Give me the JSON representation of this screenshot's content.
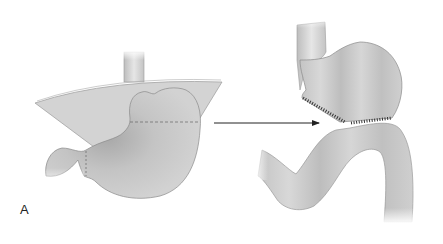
{
  "figure": {
    "panel_label": "A",
    "colors": {
      "tissue_fill": "#c9c9c9",
      "tissue_dark": "#9a9a9a",
      "tissue_light": "#e4e4e4",
      "outline": "#8a8a8a",
      "arrow": "#222222",
      "staples": "#333333",
      "background": "#ffffff"
    },
    "left_view": {
      "structures": [
        "esophagus",
        "diaphragm-omentum-flap",
        "stomach",
        "duodenum"
      ],
      "resection_line": "dashed horizontal line across upper stomach",
      "pyloric_line": "dashed vertical line at pylorus"
    },
    "arrow": {
      "direction": "right"
    },
    "right_view": {
      "structures": [
        "esophagus",
        "gastric-pouch",
        "jejunal-limb"
      ],
      "staple_line": "hatched line along pouch base"
    }
  }
}
